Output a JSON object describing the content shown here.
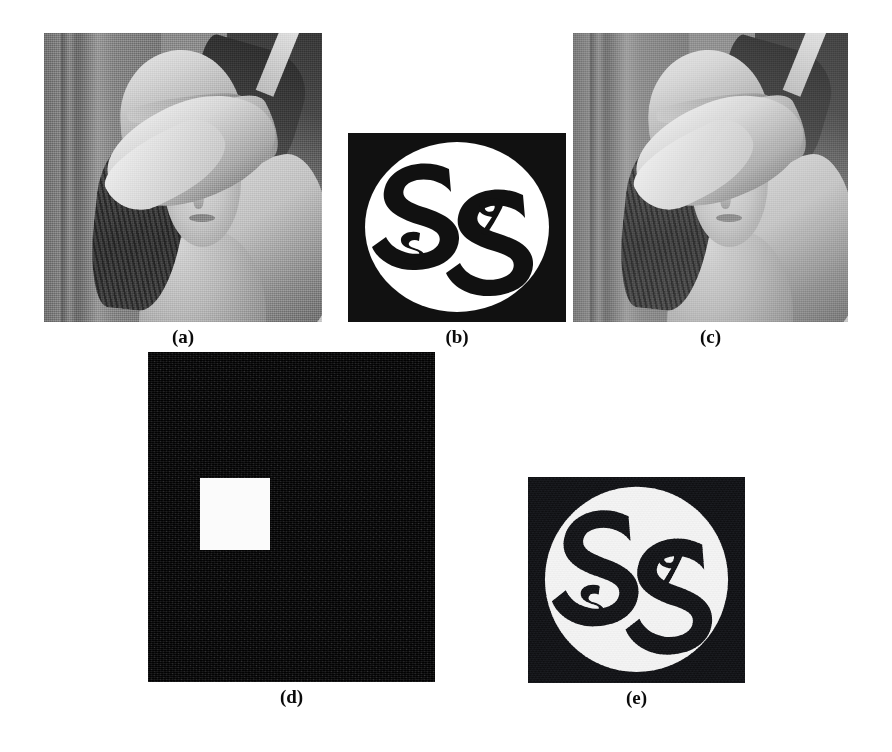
{
  "figure": {
    "background_color": "#ffffff",
    "width": 892,
    "height": 752,
    "panels": [
      {
        "id": "a",
        "caption": "(a)",
        "name": "original-host-image",
        "content_type": "grayscale-photograph",
        "subject": "Lena test image (woman wearing a wide-brimmed feathered hat)",
        "x": 44,
        "y": 33,
        "width": 278,
        "height": 289
      },
      {
        "id": "b",
        "caption": "(b)",
        "name": "original-watermark-logo",
        "content_type": "binary-logo",
        "subject": "Black square with white disc containing two interlocking bold S letters plus small letters s and g",
        "glyph_large_left": "S",
        "glyph_large_right": "S",
        "glyph_small_left": "s",
        "glyph_small_right": "g",
        "disc_color": "#ffffff",
        "field_color": "#111111",
        "x": 348,
        "y": 133,
        "width": 218,
        "height": 189
      },
      {
        "id": "c",
        "caption": "(c)",
        "name": "watermarked-image",
        "content_type": "grayscale-photograph",
        "subject": "Watermarked Lena image with visible flower detail in the hat",
        "x": 573,
        "y": 33,
        "width": 275,
        "height": 289
      },
      {
        "id": "d",
        "caption": "(d)",
        "name": "tamper-detection-map",
        "content_type": "binary-difference-map",
        "subject": "Mostly black noisy map with a single bright white square marking the tampered region",
        "field_color": "#0d0d0f",
        "block_color": "#fbfbfb",
        "block": {
          "x": 52,
          "y": 126,
          "width": 70,
          "height": 72
        },
        "x": 148,
        "y": 352,
        "width": 287,
        "height": 330
      },
      {
        "id": "e",
        "caption": "(e)",
        "name": "extracted-watermark-logo",
        "content_type": "binary-logo-noisy",
        "subject": "Recovered watermark logo, grainier than the original",
        "glyph_large_left": "S",
        "glyph_large_right": "S",
        "glyph_small_left": "s",
        "glyph_small_right": "g",
        "disc_color": "#f2f2f2",
        "field_color": "#15161a",
        "x": 528,
        "y": 477,
        "width": 217,
        "height": 206
      }
    ]
  },
  "captions": {
    "a": "(a)",
    "b": "(b)",
    "c": "(c)",
    "d": "(d)",
    "e": "(e)"
  }
}
